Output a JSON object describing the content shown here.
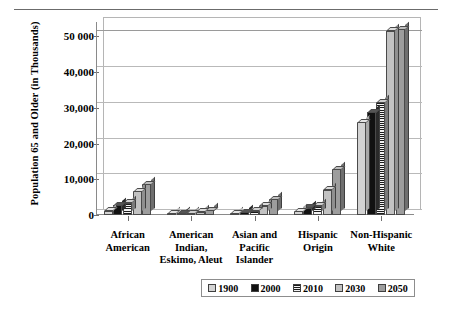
{
  "chart_data": {
    "type": "bar",
    "title": "",
    "xlabel": "",
    "ylabel": "Population 65 and Older (in Thousands)",
    "ylim": [
      0,
      54000
    ],
    "grid": true,
    "legend_position": "bottom",
    "categories": [
      "African American",
      "American Indian, Eskimo, Aleut",
      "Asian and Pacific Islander",
      "Hispanic Origin",
      "Non-Hispanic White"
    ],
    "category_lines": [
      [
        "African",
        "American"
      ],
      [
        "American",
        "Indian,",
        "Eskimo, Aleut"
      ],
      [
        "Asian and",
        "Pacific",
        "Islander"
      ],
      [
        "Hispanic",
        "Origin"
      ],
      [
        "Non-Hispanic",
        "White"
      ]
    ],
    "ytick_labels": [
      "0",
      "10,000",
      "20,000",
      "30,000",
      "40,000",
      "50 000"
    ],
    "ytick_values": [
      0,
      10000,
      20000,
      30000,
      40000,
      50000
    ],
    "series": [
      {
        "name": "1900",
        "color": "#d3d3d3",
        "values": [
          1200,
          150,
          300,
          1000,
          26000
        ]
      },
      {
        "name": "2000",
        "color": "#111111",
        "values": [
          2800,
          250,
          800,
          2000,
          28800
        ]
      },
      {
        "name": "2010",
        "color": "#1b1b1b",
        "values": [
          3400,
          350,
          1200,
          2600,
          31500
        ]
      },
      {
        "name": "2030",
        "color": "#c2c2c2",
        "values": [
          6700,
          900,
          2600,
          7000,
          51500
        ]
      },
      {
        "name": "2050",
        "color": "#9d9d9d",
        "values": [
          8600,
          1400,
          4400,
          12800,
          52000
        ]
      }
    ],
    "legend_entries": [
      "1900",
      "2000",
      "2010",
      "2030",
      "2050"
    ]
  }
}
